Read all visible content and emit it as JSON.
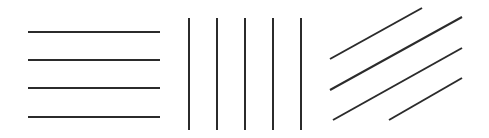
{
  "line_color": "#2b2b2b",
  "background_color": "#ffffff",
  "groups": [
    {
      "name": "horizontal",
      "orientation": "horizontal",
      "line_count": 4
    },
    {
      "name": "vertical",
      "orientation": "vertical",
      "line_count": 5
    },
    {
      "name": "diagonal",
      "orientation": "diagonal-ascending",
      "line_count": 4
    }
  ]
}
